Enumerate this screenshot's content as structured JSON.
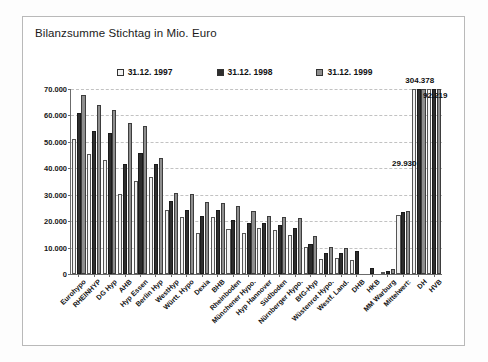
{
  "card": {
    "title": "Bilanzsumme Stichtag in Mio. Euro"
  },
  "legend": {
    "position": "top-center",
    "items": [
      {
        "label": "31.12. 1997",
        "color": "#f2f2f2"
      },
      {
        "label": "31.12. 1998",
        "color": "#2e2e2e"
      },
      {
        "label": "31.12. 1999",
        "color": "#8e8e8e"
      }
    ]
  },
  "chart_data": {
    "type": "bar",
    "title": "Bilanzsumme Stichtag in Mio. Euro",
    "xlabel": "",
    "ylabel": "",
    "ylim": [
      0,
      70000
    ],
    "grid": true,
    "legend_position": "top-center",
    "ytick_labels": [
      "70.000",
      "60.000",
      "50.000",
      "40.000",
      "30.000",
      "20.000",
      "10.000",
      "0"
    ],
    "ytick_values": [
      70000,
      60000,
      50000,
      40000,
      30000,
      20000,
      10000,
      0
    ],
    "categories": [
      "Eurohypo",
      "RHEINHYP",
      "DG Hyp",
      "AHB",
      "Hyp Essen",
      "Berlin Hyp",
      "WestHyp",
      "Württ. Hypo",
      "Dexia",
      "BHB",
      "Rheinboden",
      "Münchener Hypo.",
      "Hyp Hannover",
      "Südboden",
      "Nürnberger Hypo.",
      "BfG-Hyp",
      "Wüstenrot Hypo.",
      "Westf. Land.",
      "DHB",
      "HKB",
      "MM Warburg",
      "Mittelwert:",
      "DH",
      "HVB"
    ],
    "series": [
      {
        "name": "31.12. 1997",
        "color": "#f2f2f2",
        "values": [
          51200,
          45400,
          43300,
          30200,
          35300,
          36600,
          24200,
          21700,
          15400,
          21600,
          17200,
          15700,
          17600,
          16600,
          14600,
          10300,
          5500,
          6000,
          5200,
          0,
          600,
          22500,
          304378,
          92219
        ]
      },
      {
        "name": "31.12. 1998",
        "color": "#2e2e2e",
        "values": [
          61000,
          54000,
          53200,
          41600,
          45700,
          41500,
          27600,
          24400,
          21800,
          24100,
          20600,
          19300,
          19400,
          18700,
          17500,
          11300,
          8000,
          8000,
          8700,
          2200,
          1000,
          23300,
          304378,
          92219
        ]
      },
      {
        "name": "31.12. 1999",
        "color": "#8e8e8e",
        "values": [
          67800,
          63800,
          62100,
          57100,
          56000,
          44000,
          30800,
          30300,
          27200,
          27000,
          25800,
          23800,
          22100,
          21400,
          21300,
          14500,
          10300,
          9700,
          0,
          0,
          1800,
          24000,
          304378,
          92219
        ]
      }
    ],
    "annotations": [
      {
        "text": "304.378",
        "category": "DH",
        "value": 304378
      },
      {
        "text": "92.219",
        "category": "HVB",
        "value": 92219
      },
      {
        "text": "29.930",
        "category": "Mittelwert:",
        "value": 29930
      }
    ],
    "note": "Bars for DH, HVB and the Mittelwert group exceed the 70.000 axis maximum and are clipped; their true values are shown as data labels."
  }
}
